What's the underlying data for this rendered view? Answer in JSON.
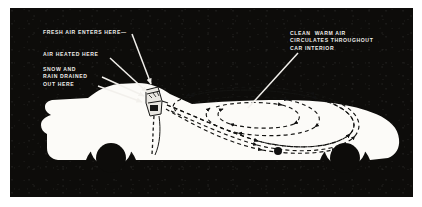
{
  "figure": {
    "kind": "automotive-heater-airflow-diagram",
    "panel_background": "#0d0c0a",
    "ink_color": "#ffffff",
    "page_background": "#ffffff"
  },
  "callouts": {
    "fresh_air": "FRESH AIR ENTERS HERE—",
    "air_heated": "AIR HEATED HERE",
    "snow_rain": "SNOW AND\nRAIN DRAINED\nOUT HERE",
    "clean_warm": "CLEAN  WARM AIR\nCIRCULATES THROUGHOUT\nCAR INTERIOR"
  },
  "elements": {
    "car_label": "car-silhouette",
    "heater_label": "heater-unit",
    "airflow_label": "airflow-spiral",
    "drain_label": "drain-path",
    "outlet_dot_label": "outlet-marker"
  }
}
